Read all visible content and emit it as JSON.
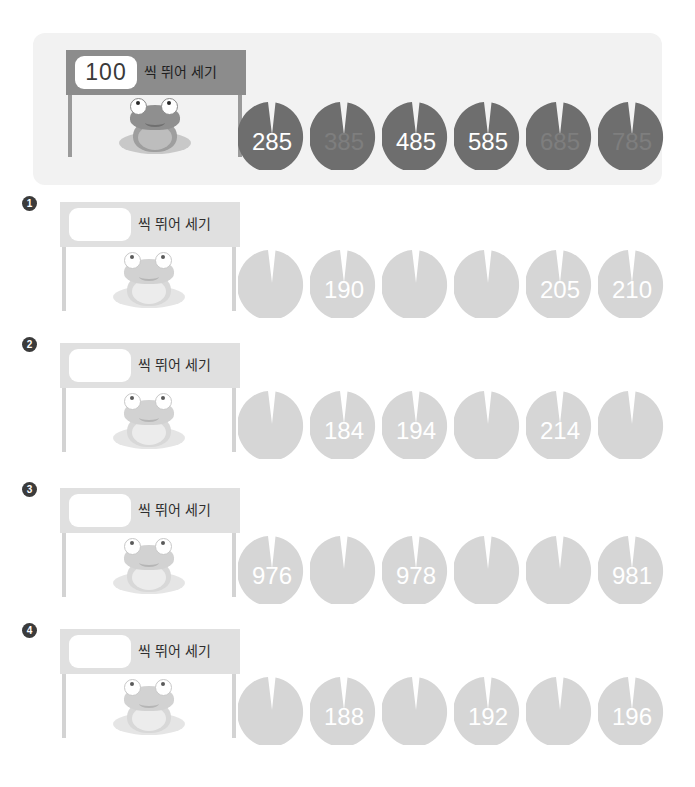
{
  "page": {
    "top_title": "",
    "label_suffix": "씩 뛰어 세기"
  },
  "example": {
    "step_value": "100",
    "label": "씩 뛰어 세기",
    "pads": [
      {
        "value": "285",
        "filled": true
      },
      {
        "value": "385",
        "filled": false
      },
      {
        "value": "485",
        "filled": true
      },
      {
        "value": "585",
        "filled": true
      },
      {
        "value": "685",
        "filled": false
      },
      {
        "value": "785",
        "filled": false
      }
    ]
  },
  "problems": [
    {
      "number": "1",
      "step_value": "",
      "label": "씩 뛰어 세기",
      "pads": [
        {
          "value": "",
          "filled": false
        },
        {
          "value": "190",
          "filled": true
        },
        {
          "value": "",
          "filled": false
        },
        {
          "value": "",
          "filled": false
        },
        {
          "value": "205",
          "filled": true
        },
        {
          "value": "210",
          "filled": true
        }
      ]
    },
    {
      "number": "2",
      "step_value": "",
      "label": "씩 뛰어 세기",
      "pads": [
        {
          "value": "",
          "filled": false
        },
        {
          "value": "184",
          "filled": true
        },
        {
          "value": "194",
          "filled": true
        },
        {
          "value": "",
          "filled": false
        },
        {
          "value": "214",
          "filled": true
        },
        {
          "value": "",
          "filled": false
        }
      ]
    },
    {
      "number": "3",
      "step_value": "",
      "label": "씩 뛰어 세기",
      "pads": [
        {
          "value": "976",
          "filled": true
        },
        {
          "value": "",
          "filled": false
        },
        {
          "value": "978",
          "filled": true
        },
        {
          "value": "",
          "filled": false
        },
        {
          "value": "",
          "filled": false
        },
        {
          "value": "981",
          "filled": true
        }
      ]
    },
    {
      "number": "4",
      "step_value": "",
      "label": "씩 뛰어 세기",
      "pads": [
        {
          "value": "",
          "filled": false
        },
        {
          "value": "188",
          "filled": true
        },
        {
          "value": "",
          "filled": false
        },
        {
          "value": "192",
          "filled": true
        },
        {
          "value": "",
          "filled": false
        },
        {
          "value": "196",
          "filled": true
        }
      ]
    }
  ],
  "colors": {
    "panel_bg": "#f2f2f2",
    "sign_dark": "#8c8c8c",
    "sign_light": "#e0e0e0",
    "pad_dark": "#6e6e6e",
    "pad_dark_faded": "#6e6e6e",
    "pad_light": "#d6d6d6",
    "badge": "#3b3b3b"
  }
}
